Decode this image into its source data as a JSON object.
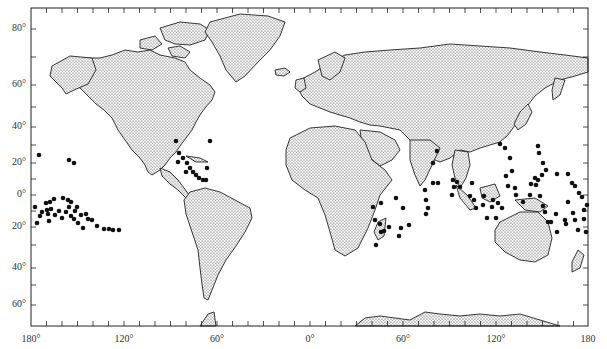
{
  "map": {
    "title": "",
    "projection": "Miller cylindrical",
    "frame": {
      "left": 31,
      "right": 588,
      "top": 8,
      "bottom": 326
    },
    "land_color": "#d9d9d9",
    "coast_color": "#222222",
    "dot_color": "#111111",
    "lat_labels": [
      {
        "text": "80°",
        "y": 29
      },
      {
        "text": "60°",
        "y": 85
      },
      {
        "text": "40°",
        "y": 127
      },
      {
        "text": "20°",
        "y": 163
      },
      {
        "text": "0°",
        "y": 195
      },
      {
        "text": "20°",
        "y": 227
      },
      {
        "text": "40°",
        "y": 268
      },
      {
        "text": "60°",
        "y": 305
      }
    ],
    "lon_labels": [
      {
        "text": "180°",
        "x": 31
      },
      {
        "text": "120°",
        "x": 124
      },
      {
        "text": "60°",
        "x": 217
      },
      {
        "text": "0°",
        "x": 310
      },
      {
        "text": "60°",
        "x": 403
      },
      {
        "text": "120°",
        "x": 496
      },
      {
        "text": "180",
        "x": 588
      }
    ]
  },
  "chart_data": {
    "type": "scatter",
    "title": "",
    "xlabel": "Longitude",
    "ylabel": "Latitude",
    "x_ticks": [
      "180°",
      "120°",
      "60°",
      "0°",
      "60°",
      "120°",
      "180"
    ],
    "y_ticks": [
      "80°",
      "60°",
      "40°",
      "20°",
      "0°",
      "20°",
      "40°",
      "60°"
    ],
    "series": [
      {
        "name": "point locations (pixel coords)",
        "points": [
          [
            39,
            155
          ],
          [
            35,
            207
          ],
          [
            37,
            223
          ],
          [
            40,
            216
          ],
          [
            42,
            212
          ],
          [
            46,
            203
          ],
          [
            47,
            210
          ],
          [
            50,
            202
          ],
          [
            48,
            214
          ],
          [
            49,
            221
          ],
          [
            51,
            209
          ],
          [
            54,
            199
          ],
          [
            55,
            215
          ],
          [
            59,
            211
          ],
          [
            62,
            218
          ],
          [
            63,
            198
          ],
          [
            68,
            200
          ],
          [
            66,
            212
          ],
          [
            69,
            207
          ],
          [
            71,
            202
          ],
          [
            71,
            216
          ],
          [
            74,
            219
          ],
          [
            75,
            211
          ],
          [
            77,
            207
          ],
          [
            78,
            223
          ],
          [
            81,
            215
          ],
          [
            83,
            228
          ],
          [
            86,
            214
          ],
          [
            88,
            219
          ],
          [
            92,
            220
          ],
          [
            97,
            226
          ],
          [
            104,
            229
          ],
          [
            109,
            229
          ],
          [
            113,
            230
          ],
          [
            119,
            230
          ],
          [
            69,
            160
          ],
          [
            74,
            163
          ],
          [
            176,
            141
          ],
          [
            179,
            153
          ],
          [
            183,
            158
          ],
          [
            187,
            163
          ],
          [
            190,
            168
          ],
          [
            193,
            172
          ],
          [
            196,
            175
          ],
          [
            199,
            178
          ],
          [
            203,
            180
          ],
          [
            206,
            180
          ],
          [
            210,
            141
          ],
          [
            207,
            168
          ],
          [
            178,
            162
          ],
          [
            186,
            172
          ],
          [
            373,
            207
          ],
          [
            375,
            220
          ],
          [
            380,
            224
          ],
          [
            381,
            232
          ],
          [
            376,
            245
          ],
          [
            384,
            231
          ],
          [
            381,
            203
          ],
          [
            396,
            198
          ],
          [
            403,
            208
          ],
          [
            389,
            227
          ],
          [
            401,
            228
          ],
          [
            399,
            236
          ],
          [
            409,
            225
          ],
          [
            426,
            214
          ],
          [
            425,
            190
          ],
          [
            426,
            200
          ],
          [
            428,
            208
          ],
          [
            433,
            183
          ],
          [
            438,
            183
          ],
          [
            433,
            163
          ],
          [
            437,
            151
          ],
          [
            453,
            180
          ],
          [
            454,
            187
          ],
          [
            457,
            182
          ],
          [
            452,
            195
          ],
          [
            460,
            187
          ],
          [
            472,
            183
          ],
          [
            470,
            196
          ],
          [
            474,
            200
          ],
          [
            476,
            208
          ],
          [
            483,
            205
          ],
          [
            484,
            196
          ],
          [
            493,
            200
          ],
          [
            492,
            207
          ],
          [
            487,
            218
          ],
          [
            496,
            218
          ],
          [
            498,
            203
          ],
          [
            502,
            208
          ],
          [
            506,
            176
          ],
          [
            508,
            186
          ],
          [
            512,
            171
          ],
          [
            510,
            158
          ],
          [
            500,
            144
          ],
          [
            505,
            148
          ],
          [
            515,
            188
          ],
          [
            516,
            195
          ],
          [
            523,
            202
          ],
          [
            531,
            184
          ],
          [
            530,
            195
          ],
          [
            535,
            178
          ],
          [
            536,
            185
          ],
          [
            538,
            180
          ],
          [
            540,
            196
          ],
          [
            543,
            206
          ],
          [
            545,
            212
          ],
          [
            548,
            222
          ],
          [
            551,
            222
          ],
          [
            556,
            214
          ],
          [
            557,
            232
          ],
          [
            565,
            220
          ],
          [
            566,
            224
          ],
          [
            568,
            202
          ],
          [
            573,
            213
          ],
          [
            575,
            220
          ],
          [
            578,
            230
          ],
          [
            584,
            219
          ],
          [
            586,
            232
          ],
          [
            538,
            146
          ],
          [
            539,
            153
          ],
          [
            543,
            163
          ],
          [
            546,
            170
          ],
          [
            542,
            175
          ],
          [
            557,
            174
          ],
          [
            568,
            174
          ],
          [
            572,
            183
          ],
          [
            575,
            186
          ],
          [
            579,
            193
          ],
          [
            582,
            197
          ],
          [
            584,
            210
          ],
          [
            587,
            205
          ]
        ]
      }
    ]
  }
}
